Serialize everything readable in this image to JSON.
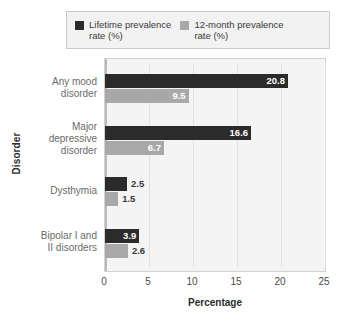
{
  "chart_data": {
    "type": "bar",
    "orientation": "horizontal",
    "title": "",
    "xlabel": "Percentage",
    "ylabel": "Disorder",
    "xlim": [
      0,
      25
    ],
    "xticks": [
      "0",
      "5",
      "10",
      "15",
      "20",
      "25"
    ],
    "grid": true,
    "legend_position": "top",
    "categories": [
      "Any mood\ndisorder",
      "Major\ndepressive\ndisorder",
      "Dysthymia",
      "Bipolar I and\nII disorders"
    ],
    "series": [
      {
        "name": "Lifetime prevalence\nrate (%)",
        "color": "#2b2b2b",
        "values": [
          20.8,
          16.6,
          2.5,
          3.9
        ],
        "labels": [
          "20.8",
          "16.6",
          "2.5",
          "3.9"
        ]
      },
      {
        "name": "12-month prevalence\nrate (%)",
        "color": "#a8a8a8",
        "values": [
          9.5,
          6.7,
          1.5,
          2.6
        ],
        "labels": [
          "9.5",
          "6.7",
          "1.5",
          "2.6"
        ]
      }
    ]
  },
  "legend": {
    "entries": [
      {
        "label": "Lifetime prevalence\nrate (%)",
        "color": "#2b2b2b"
      },
      {
        "label": "12-month prevalence\nrate (%)",
        "color": "#a8a8a8"
      }
    ]
  },
  "axes": {
    "x_title": "Percentage",
    "y_title": "Disorder"
  }
}
